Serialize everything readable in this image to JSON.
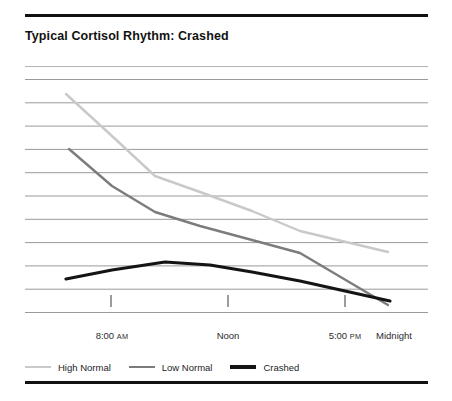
{
  "chart_data": {
    "type": "line",
    "title": "Typical Cortisol Rhythm: Crashed",
    "xlabel": "",
    "ylabel": "",
    "grid": "horizontal",
    "gridlines": 11,
    "legend_position": "bottom-left",
    "x": [
      0,
      1,
      2,
      3,
      4,
      5,
      6
    ],
    "x_positions_px": [
      66,
      112,
      155,
      200,
      252,
      300,
      388
    ],
    "xticks": [
      {
        "label": "8:00",
        "ampm": "AM",
        "px": 112
      },
      {
        "label": "Noon",
        "ampm": "",
        "px": 228
      },
      {
        "label": "5:00",
        "ampm": "PM",
        "px": 345
      },
      {
        "label": "Midnight",
        "ampm": "",
        "px": 394
      }
    ],
    "xtick_labels": [
      "8:00 AM",
      "Noon",
      "5:00 PM",
      "Midnight"
    ],
    "ylim": [
      0,
      10
    ],
    "y_gridline_values": [
      10,
      9,
      8,
      7,
      6,
      5,
      4,
      3,
      2,
      1,
      0
    ],
    "series": [
      {
        "name": "High Normal",
        "color": "#c9c9c9",
        "width": 2.4,
        "values": [
          9.3,
          7.4,
          5.7,
          5.0,
          4.2,
          3.3,
          1.6
        ],
        "points_px": [
          [
            66,
            94
          ],
          [
            112,
            136
          ],
          [
            155,
            176
          ],
          [
            200,
            192
          ],
          [
            252,
            211
          ],
          [
            300,
            231
          ],
          [
            388,
            252
          ]
        ]
      },
      {
        "name": "Low Normal",
        "color": "#7c7c7c",
        "width": 2.4,
        "values": [
          6.9,
          5.1,
          4.0,
          3.4,
          2.8,
          2.3,
          0.5
        ],
        "points_px": [
          [
            69,
            149
          ],
          [
            112,
            186
          ],
          [
            155,
            212
          ],
          [
            200,
            226
          ],
          [
            252,
            240
          ],
          [
            300,
            253
          ],
          [
            388,
            305
          ]
        ]
      },
      {
        "name": "Crashed",
        "color": "#141414",
        "width": 3.2,
        "values": [
          1.55,
          1.9,
          2.1,
          2.05,
          1.85,
          1.6,
          0.65
        ],
        "points_px": [
          [
            66,
            279
          ],
          [
            112,
            270
          ],
          [
            165,
            262
          ],
          [
            210,
            265
          ],
          [
            252,
            272
          ],
          [
            300,
            281
          ],
          [
            390,
            301
          ]
        ]
      }
    ]
  },
  "legend": {
    "items": [
      {
        "label": "High Normal",
        "color": "#c9c9c9"
      },
      {
        "label": "Low Normal",
        "color": "#7c7c7c"
      },
      {
        "label": "Crashed",
        "color": "#141414"
      }
    ]
  },
  "axis": {
    "ticks_px": [
      111,
      228,
      345
    ],
    "tick_top_px": 295,
    "tick_bottom_px": 307
  }
}
